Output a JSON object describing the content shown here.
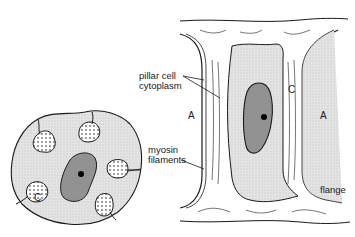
{
  "figure": {
    "left_panel": {
      "title": "pillar cell cross-section",
      "labels": {
        "channel": "C"
      }
    },
    "right_panel": {
      "title": "pillar cell longitudinal view",
      "labels": {
        "space_left": "A",
        "space_right": "A",
        "channel": "C",
        "flange": "flange"
      }
    },
    "callouts": {
      "pillar_cell_cytoplasm_line1": "pillar cell",
      "pillar_cell_cytoplasm_line2": "cytoplasm",
      "myosin_filaments_line1": "myosin",
      "myosin_filaments_line2": "filaments"
    },
    "colors": {
      "ink": "#1a1a1a",
      "cytoplasm_fill": "#d9d9d9",
      "nucleus_fill": "#8f8f8f",
      "nucleolus": "#000000",
      "background": "#ffffff"
    }
  }
}
